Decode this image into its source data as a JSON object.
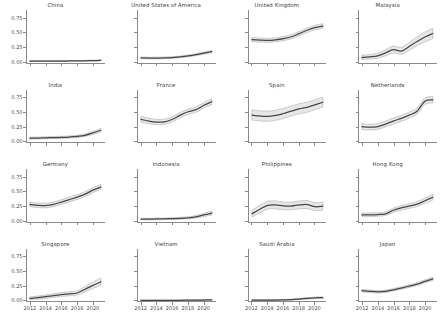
{
  "figure": {
    "background": "#ffffff",
    "line_color": "#474747",
    "band_color": "#d4d4d4",
    "axis_color": "#8a8a8a"
  },
  "chart_data": {
    "type": "line",
    "title": "",
    "xlabel": "",
    "ylabel": "",
    "xlim": [
      2011.5,
      2021.5
    ],
    "ylim": [
      -0.03,
      0.88
    ],
    "grid": false,
    "legend": "none",
    "layout": {
      "rows": 4,
      "cols": 4,
      "shared_x": true,
      "shared_y": true
    },
    "x": [
      2012,
      2013,
      2014,
      2015,
      2016,
      2017,
      2018,
      2019,
      2020,
      2021
    ],
    "xticks": [
      2012,
      2014,
      2016,
      2018,
      2020
    ],
    "xticklabels": [
      "2012",
      "2014",
      "2016",
      "2018",
      "2020"
    ],
    "yticks": [
      0.0,
      0.25,
      0.5,
      0.75
    ],
    "yticklabels": [
      "0.00",
      "0.25",
      "0.50",
      "0.75"
    ],
    "band_description": "shaded 95% confidence interval around each mean line",
    "panels": [
      {
        "title": "China",
        "values": [
          0.01,
          0.01,
          0.011,
          0.012,
          0.012,
          0.013,
          0.014,
          0.016,
          0.019,
          0.024
        ],
        "lower": [
          0.004,
          0.005,
          0.006,
          0.007,
          0.007,
          0.008,
          0.009,
          0.01,
          0.012,
          0.015
        ],
        "upper": [
          0.017,
          0.017,
          0.018,
          0.019,
          0.019,
          0.02,
          0.021,
          0.023,
          0.027,
          0.034
        ]
      },
      {
        "title": "United States of America",
        "values": [
          0.065,
          0.062,
          0.062,
          0.066,
          0.072,
          0.082,
          0.098,
          0.12,
          0.148,
          0.172
        ],
        "lower": [
          0.05,
          0.048,
          0.048,
          0.052,
          0.058,
          0.068,
          0.083,
          0.104,
          0.13,
          0.152
        ],
        "upper": [
          0.081,
          0.077,
          0.077,
          0.081,
          0.087,
          0.097,
          0.114,
          0.137,
          0.167,
          0.193
        ]
      },
      {
        "title": "United Kingdom",
        "values": [
          0.375,
          0.368,
          0.362,
          0.372,
          0.392,
          0.425,
          0.478,
          0.535,
          0.58,
          0.605
        ],
        "lower": [
          0.34,
          0.334,
          0.329,
          0.339,
          0.358,
          0.39,
          0.442,
          0.498,
          0.542,
          0.564
        ],
        "upper": [
          0.412,
          0.404,
          0.397,
          0.407,
          0.428,
          0.462,
          0.516,
          0.574,
          0.62,
          0.648
        ]
      },
      {
        "title": "Malaysia",
        "values": [
          0.072,
          0.082,
          0.098,
          0.15,
          0.205,
          0.18,
          0.26,
          0.345,
          0.42,
          0.48
        ],
        "lower": [
          0.038,
          0.046,
          0.058,
          0.102,
          0.15,
          0.124,
          0.196,
          0.272,
          0.34,
          0.392
        ],
        "upper": [
          0.112,
          0.124,
          0.144,
          0.204,
          0.266,
          0.242,
          0.33,
          0.424,
          0.506,
          0.572
        ]
      },
      {
        "title": "India",
        "values": [
          0.06,
          0.062,
          0.066,
          0.07,
          0.074,
          0.08,
          0.09,
          0.11,
          0.15,
          0.195
        ],
        "lower": [
          0.044,
          0.046,
          0.05,
          0.054,
          0.058,
          0.063,
          0.072,
          0.09,
          0.126,
          0.166
        ],
        "upper": [
          0.078,
          0.08,
          0.084,
          0.088,
          0.092,
          0.099,
          0.11,
          0.132,
          0.176,
          0.226
        ]
      },
      {
        "title": "France",
        "values": [
          0.38,
          0.352,
          0.335,
          0.338,
          0.382,
          0.452,
          0.51,
          0.545,
          0.62,
          0.68
        ],
        "lower": [
          0.332,
          0.306,
          0.29,
          0.294,
          0.338,
          0.406,
          0.464,
          0.5,
          0.574,
          0.63
        ],
        "upper": [
          0.43,
          0.4,
          0.382,
          0.384,
          0.428,
          0.5,
          0.558,
          0.592,
          0.668,
          0.732
        ]
      },
      {
        "title": "Spain",
        "values": [
          0.452,
          0.438,
          0.432,
          0.448,
          0.48,
          0.52,
          0.56,
          0.585,
          0.628,
          0.672
        ],
        "lower": [
          0.368,
          0.354,
          0.348,
          0.364,
          0.396,
          0.436,
          0.476,
          0.502,
          0.546,
          0.592
        ],
        "upper": [
          0.54,
          0.526,
          0.52,
          0.536,
          0.568,
          0.608,
          0.648,
          0.672,
          0.714,
          0.756
        ]
      },
      {
        "title": "Netherlands",
        "values": [
          0.255,
          0.248,
          0.258,
          0.3,
          0.352,
          0.398,
          0.452,
          0.52,
          0.69,
          0.712
        ],
        "lower": [
          0.206,
          0.2,
          0.21,
          0.25,
          0.3,
          0.346,
          0.4,
          0.468,
          0.636,
          0.658
        ],
        "upper": [
          0.306,
          0.298,
          0.308,
          0.352,
          0.406,
          0.452,
          0.506,
          0.574,
          0.746,
          0.768
        ]
      },
      {
        "title": "Germany",
        "values": [
          0.275,
          0.262,
          0.258,
          0.278,
          0.318,
          0.36,
          0.402,
          0.452,
          0.52,
          0.572
        ],
        "lower": [
          0.236,
          0.224,
          0.22,
          0.24,
          0.278,
          0.32,
          0.362,
          0.412,
          0.478,
          0.528
        ],
        "upper": [
          0.316,
          0.302,
          0.298,
          0.318,
          0.36,
          0.402,
          0.444,
          0.494,
          0.564,
          0.618
        ]
      },
      {
        "title": "Indonesia",
        "values": [
          0.028,
          0.028,
          0.03,
          0.032,
          0.036,
          0.04,
          0.048,
          0.066,
          0.098,
          0.128
        ],
        "lower": [
          0.016,
          0.016,
          0.018,
          0.02,
          0.022,
          0.026,
          0.032,
          0.046,
          0.072,
          0.096
        ],
        "upper": [
          0.042,
          0.042,
          0.044,
          0.046,
          0.052,
          0.058,
          0.068,
          0.09,
          0.128,
          0.164
        ]
      },
      {
        "title": "Philippines",
        "values": [
          0.118,
          0.195,
          0.262,
          0.268,
          0.252,
          0.25,
          0.268,
          0.275,
          0.238,
          0.248
        ],
        "lower": [
          0.062,
          0.132,
          0.196,
          0.202,
          0.188,
          0.186,
          0.202,
          0.208,
          0.172,
          0.18
        ],
        "upper": [
          0.18,
          0.262,
          0.33,
          0.336,
          0.318,
          0.316,
          0.336,
          0.344,
          0.306,
          0.32
        ]
      },
      {
        "title": "Hong Kong",
        "values": [
          0.098,
          0.1,
          0.106,
          0.118,
          0.178,
          0.218,
          0.248,
          0.282,
          0.34,
          0.4
        ],
        "lower": [
          0.068,
          0.07,
          0.076,
          0.088,
          0.142,
          0.18,
          0.21,
          0.242,
          0.296,
          0.352
        ],
        "upper": [
          0.13,
          0.132,
          0.138,
          0.15,
          0.214,
          0.256,
          0.288,
          0.324,
          0.386,
          0.45
        ]
      },
      {
        "title": "Singapore",
        "values": [
          0.04,
          0.052,
          0.068,
          0.088,
          0.105,
          0.118,
          0.132,
          0.196,
          0.262,
          0.32
        ],
        "lower": [
          0.016,
          0.026,
          0.04,
          0.058,
          0.072,
          0.084,
          0.096,
          0.152,
          0.21,
          0.258
        ],
        "upper": [
          0.066,
          0.08,
          0.098,
          0.12,
          0.14,
          0.154,
          0.17,
          0.242,
          0.318,
          0.386
        ]
      },
      {
        "title": "Vietnam",
        "values": [
          0.006,
          0.006,
          0.007,
          0.007,
          0.008,
          0.008,
          0.009,
          0.01,
          0.012,
          0.014
        ],
        "lower": [
          0.002,
          0.002,
          0.003,
          0.003,
          0.003,
          0.004,
          0.004,
          0.005,
          0.006,
          0.007
        ],
        "upper": [
          0.011,
          0.011,
          0.012,
          0.012,
          0.013,
          0.014,
          0.015,
          0.016,
          0.019,
          0.022
        ]
      },
      {
        "title": "Saudi Arabia",
        "values": [
          0.01,
          0.01,
          0.011,
          0.012,
          0.014,
          0.018,
          0.028,
          0.04,
          0.05,
          0.052
        ],
        "lower": [
          0.004,
          0.004,
          0.005,
          0.006,
          0.007,
          0.01,
          0.018,
          0.028,
          0.036,
          0.038
        ],
        "upper": [
          0.017,
          0.017,
          0.018,
          0.02,
          0.022,
          0.027,
          0.039,
          0.053,
          0.065,
          0.068
        ]
      },
      {
        "title": "Japan",
        "values": [
          0.172,
          0.16,
          0.152,
          0.16,
          0.186,
          0.216,
          0.248,
          0.282,
          0.33,
          0.372
        ],
        "lower": [
          0.15,
          0.138,
          0.131,
          0.139,
          0.164,
          0.194,
          0.225,
          0.258,
          0.304,
          0.344
        ],
        "upper": [
          0.194,
          0.182,
          0.173,
          0.181,
          0.208,
          0.238,
          0.271,
          0.306,
          0.356,
          0.4
        ]
      }
    ]
  }
}
